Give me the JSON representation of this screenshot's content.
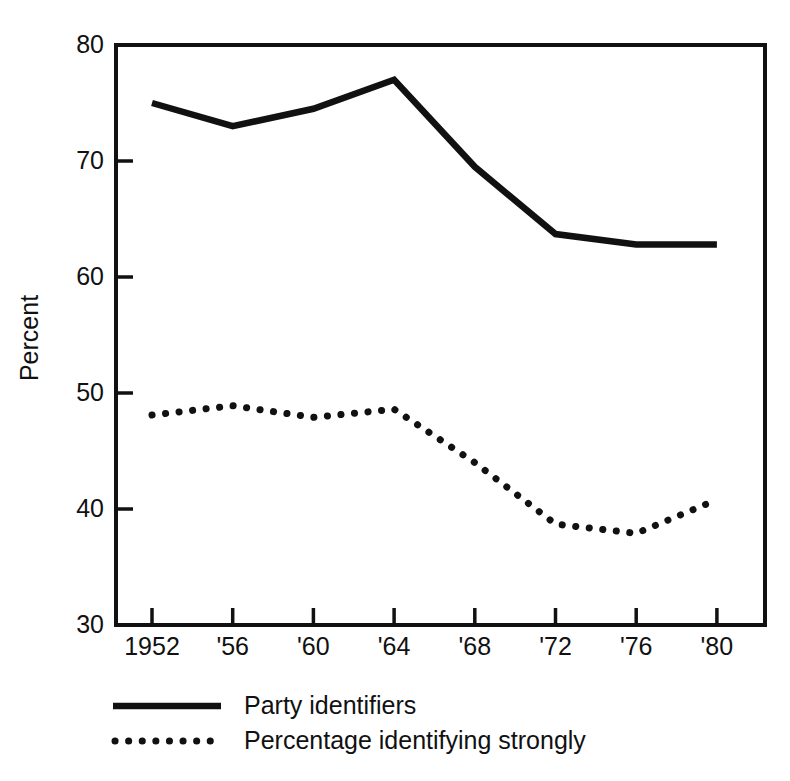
{
  "chart_data": {
    "type": "line",
    "title": "",
    "xlabel": "",
    "ylabel": "Percent",
    "ylim": [
      30,
      80
    ],
    "ytick_labels": [
      "30",
      "40",
      "50",
      "60",
      "70",
      "80"
    ],
    "yticks": [
      30,
      40,
      50,
      60,
      70,
      80
    ],
    "grid": false,
    "legend_position": "bottom",
    "categories": [
      "1952",
      "'56",
      "'60",
      "'64",
      "'68",
      "'72",
      "'76",
      "'80"
    ],
    "x_values": [
      1952,
      1956,
      1960,
      1964,
      1968,
      1972,
      1976,
      1980
    ],
    "series": [
      {
        "name": "Party identifiers",
        "style": "solid",
        "color": "#111111",
        "values": [
          75,
          73,
          74.5,
          77,
          69.5,
          63.7,
          62.8,
          62.8
        ]
      },
      {
        "name": "Percentage identifying strongly",
        "style": "dotted",
        "color": "#111111",
        "values": [
          48.1,
          48.9,
          47.9,
          48.6,
          44.0,
          38.7,
          37.9,
          40.8
        ]
      }
    ]
  },
  "legend": {
    "items": [
      {
        "label": "Party identifiers",
        "style": "solid"
      },
      {
        "label": "Percentage identifying strongly",
        "style": "dotted"
      }
    ]
  }
}
